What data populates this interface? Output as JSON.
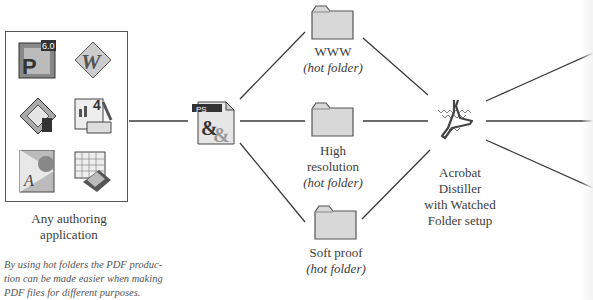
{
  "diagram": {
    "authoring": {
      "label_line1": "Any authoring",
      "label_line2": "application",
      "icons": [
        "powerpoint-icon",
        "word-icon",
        "drawing-app-icon",
        "publisher-app-icon",
        "acrobat-reader-icon",
        "spreadsheet-icon"
      ],
      "badge_text": "6.0"
    },
    "postscript": {
      "badge": "PS",
      "glyph": "&&"
    },
    "folders": [
      {
        "name": "WWW",
        "sub": "(hot folder)"
      },
      {
        "name_line1": "High",
        "name_line2": "resolution",
        "sub": "(hot folder)"
      },
      {
        "name": "Soft proof",
        "sub": "(hot folder)"
      }
    ],
    "distiller": {
      "line1": "Acrobat",
      "line2": "Distiller",
      "line3": "with Watched",
      "line4": "Folder setup"
    },
    "caption": {
      "line1": "By using hot folders the PDF produc-",
      "line2": "tion can be made easier when making",
      "line3": "PDF files for different purposes."
    },
    "colors": {
      "line": "#3a3a3a",
      "folder_fill": "#d8d8d8",
      "folder_stroke": "#555555"
    }
  }
}
